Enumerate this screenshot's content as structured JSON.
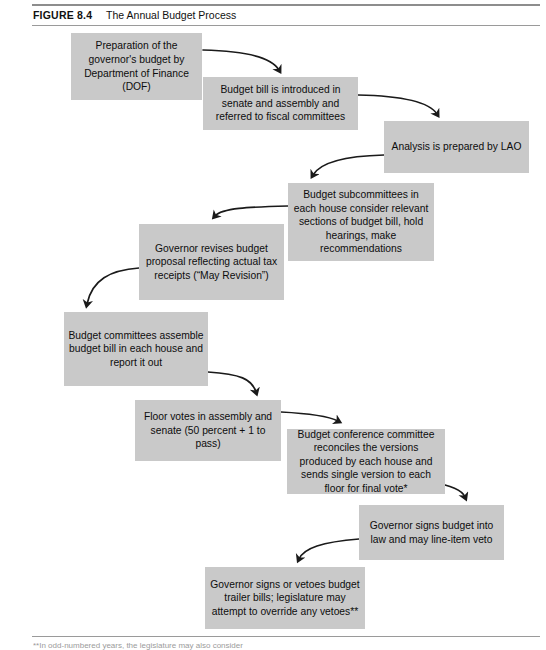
{
  "figure": {
    "label": "FIGURE 8.4",
    "title": "The Annual Budget Process",
    "footnote_partial": "**In odd-numbered years, the legislature may also consider"
  },
  "colors": {
    "box_fill": "#c9c9c9",
    "box_text": "#0d0d0d",
    "arrow": "#1a1a1a",
    "rule": "#9a9a9a",
    "page_background": "#ffffff"
  },
  "flow": {
    "steps": [
      {
        "id": "step-1-dof-preparation",
        "name": "preparation-of-governors-budget-box",
        "text": "Preparation of the governor's budget by Department of Finance (DOF)",
        "x": 71,
        "y": 33,
        "width": 131,
        "height": 67
      },
      {
        "id": "step-2-bill-introduced",
        "name": "budget-bill-introduced-box",
        "text": "Budget bill is introduced in senate and assembly and referred to fiscal committees",
        "x": 203,
        "y": 77,
        "width": 155,
        "height": 53
      },
      {
        "id": "step-3-lao-analysis",
        "name": "lao-analysis-box",
        "text": "Analysis is prepared by LAO",
        "x": 384,
        "y": 121,
        "width": 145,
        "height": 52
      },
      {
        "id": "step-4-subcommittees",
        "name": "budget-subcommittees-box",
        "text": "Budget subcommittees in each house consider relevant sections of budget bill, hold hearings, make recommendations",
        "x": 288,
        "y": 183,
        "width": 146,
        "height": 78
      },
      {
        "id": "step-5-may-revision",
        "name": "governor-revises-budget-box",
        "text": "Governor revises budget proposal reflecting actual tax receipts (“May Revision”)",
        "x": 139,
        "y": 224,
        "width": 145,
        "height": 76
      },
      {
        "id": "step-6-budget-committees",
        "name": "budget-committees-assemble-box",
        "text": "Budget committees assemble budget bill in each house and report it out",
        "x": 64,
        "y": 312,
        "width": 144,
        "height": 74
      },
      {
        "id": "step-7-floor-votes",
        "name": "floor-votes-box",
        "text": "Floor votes in assembly and senate (50 percent + 1 to pass)",
        "x": 135,
        "y": 400,
        "width": 146,
        "height": 61
      },
      {
        "id": "step-8-conference-committee",
        "name": "budget-conference-committee-box",
        "text": "Budget conference committee reconciles the versions produced by each house and sends single version to each floor for final vote*",
        "x": 287,
        "y": 429,
        "width": 158,
        "height": 65
      },
      {
        "id": "step-9-governor-signs",
        "name": "governor-signs-budget-box",
        "text": "Governor signs budget into law and may line-item veto",
        "x": 359,
        "y": 505,
        "width": 145,
        "height": 55
      },
      {
        "id": "step-10-trailer-bills",
        "name": "governor-signs-or-vetoes-trailer-bills-box",
        "text": "Governor signs or vetoes budget trailer bills; legislature may attempt to override any vetoes**",
        "x": 205,
        "y": 567,
        "width": 160,
        "height": 62
      }
    ],
    "connectors": [
      {
        "name": "arrow-step1-to-step2",
        "from": "step-1-dof-preparation",
        "to": "step-2-bill-introduced",
        "path": "M 203 50 C 248 51 272 58 279 70",
        "direction": "down-right"
      },
      {
        "name": "arrow-step2-to-step3",
        "from": "step-2-bill-introduced",
        "to": "step-3-lao-analysis",
        "path": "M 358 95 C 408 96 430 103 437 114",
        "direction": "down-right"
      },
      {
        "name": "arrow-step3-to-step4",
        "from": "step-3-lao-analysis",
        "to": "step-4-subcommittees",
        "path": "M 384 155 C 344 156 320 163 313 175",
        "direction": "down-left"
      },
      {
        "name": "arrow-step4-to-step5",
        "from": "step-4-subcommittees",
        "to": "step-5-may-revision",
        "path": "M 288 206 C 248 207 222 208 215 216",
        "direction": "down-left"
      },
      {
        "name": "arrow-step5-to-step6",
        "from": "step-5-may-revision",
        "to": "step-6-budget-committees",
        "path": "M 139 268 C 110 270 92 280 87 304",
        "direction": "down-left"
      },
      {
        "name": "arrow-step6-to-step7",
        "from": "step-6-budget-committees",
        "to": "step-7-floor-votes",
        "path": "M 208 372 C 240 374 252 379 256 392",
        "direction": "down-right"
      },
      {
        "name": "arrow-step7-to-step8",
        "from": "step-7-floor-votes",
        "to": "step-8-conference-committee",
        "path": "M 281 412 C 320 414 332 418 338 421",
        "direction": "down-right"
      },
      {
        "name": "arrow-step8-to-step9",
        "from": "step-8-conference-committee",
        "to": "step-9-governor-signs",
        "path": "M 429 481 C 452 486 462 490 465 497",
        "direction": "down-right"
      },
      {
        "name": "arrow-step9-to-step10",
        "from": "step-9-governor-signs",
        "to": "step-10-trailer-bills",
        "path": "M 359 539 C 322 542 304 548 299 559",
        "direction": "down-left"
      }
    ]
  }
}
